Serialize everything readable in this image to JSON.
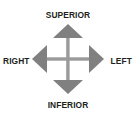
{
  "figure": {
    "name": "anatomical-orientation-compass",
    "background_color": "#ffffff",
    "labels": {
      "superior": "SUPERIOR",
      "inferior": "INFERIOR",
      "right": "RIGHT",
      "left": "LEFT"
    },
    "label_color": "#231f20",
    "graphic": {
      "arrow_fill": "#808080",
      "axis_line_color": "#9a9a9a",
      "directions": [
        "up-arrow",
        "down-arrow",
        "left-arrow",
        "right-arrow"
      ]
    }
  }
}
